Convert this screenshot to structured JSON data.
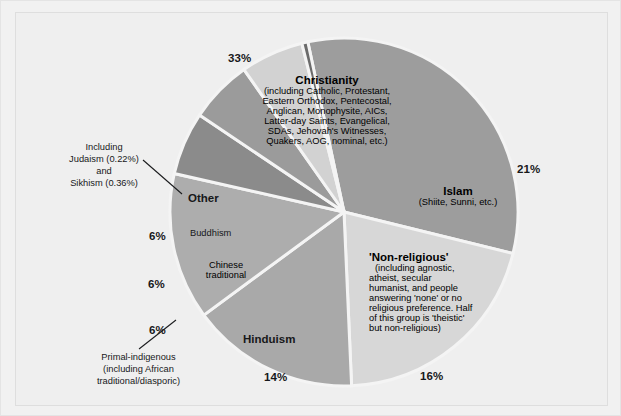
{
  "chart_data": {
    "type": "pie",
    "title": "",
    "categories": [
      "Christianity",
      "Islam",
      "'Non-religious'",
      "Hinduism",
      "Primal-indigenous",
      "Chinese traditional",
      "Buddhism",
      "Other"
    ],
    "values": [
      33,
      21,
      16,
      14,
      6,
      6,
      6,
      0.58
    ],
    "labels": [
      "33%",
      "21%",
      "16%",
      "14%",
      "6%",
      "6%",
      "6%",
      ""
    ],
    "colors": [
      "#9d9d9d",
      "#d7d7d7",
      "#a9a9a9",
      "#adadad",
      "#8b8b8b",
      "#9b9b9b",
      "#d2d2d2",
      "#6b6b6b"
    ],
    "legend": "none",
    "grid": false
  },
  "slices": {
    "christianity": {
      "name": "Christianity",
      "pct": "33%",
      "detail": [
        "(including Catholic, Protestant,",
        "Eastern Orthodox, Pentecostal,",
        "Anglican, Monophysite, AICs,",
        "Latter-day Saints, Evangelical,",
        "SDAs, Jehovah's Witnesses,",
        "Quakers, AOG, nominal, etc.)"
      ]
    },
    "islam": {
      "name": "Islam",
      "pct": "21%",
      "detail": [
        "(Shiite, Sunni, etc.)"
      ]
    },
    "nonreligious": {
      "name": "'Non-religious'",
      "pct": "16%",
      "detail": [
        "(including agnostic,",
        "atheist, secular",
        "humanist, and people",
        "answering 'none' or no",
        "religious preference. Half",
        "of this group is 'theistic'",
        "but non-religious)"
      ]
    },
    "hinduism": {
      "name": "Hinduism",
      "pct": "14%",
      "detail": []
    },
    "primal": {
      "name": "Primal-indigenous",
      "pct": "6%",
      "detail": [
        "(including African",
        "traditional/diasporic)"
      ]
    },
    "chinese": {
      "name_line1": "Chinese",
      "name_line2": "traditional",
      "pct": "6%"
    },
    "buddhism": {
      "name": "Buddhism",
      "pct": "6%"
    },
    "other": {
      "name": "Other",
      "callout": [
        "Including",
        "Judaism (0.22%)",
        "and",
        "Sikhism (0.36%)"
      ]
    }
  }
}
